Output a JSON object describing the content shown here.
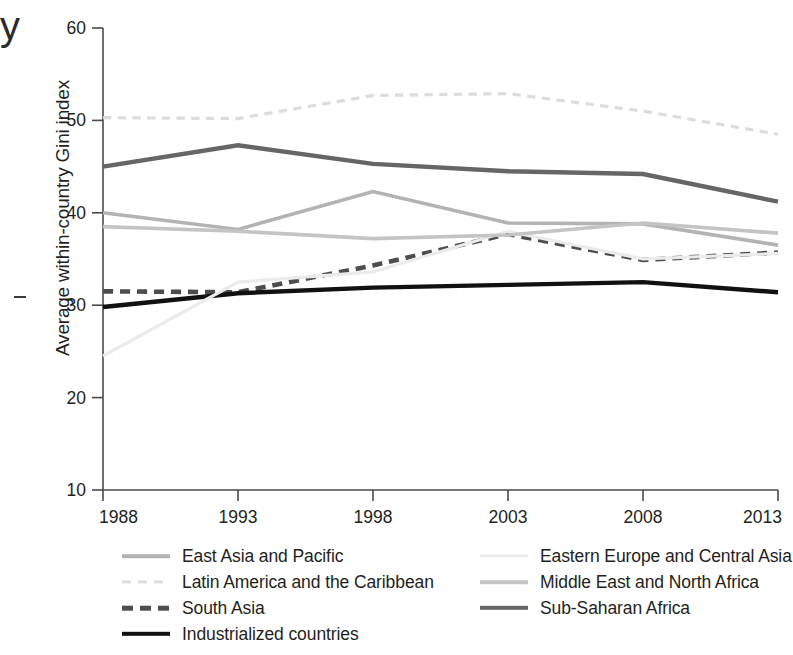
{
  "figure": {
    "cropped_text_fragment": "y",
    "y_axis_title": "Average within-country Gini index"
  },
  "chart_data": {
    "type": "line",
    "title": "",
    "xlabel": "",
    "ylabel": "Average within-country Gini index",
    "x": [
      1988,
      1993,
      1998,
      2003,
      2008,
      2013
    ],
    "xtick_labels": [
      "1988",
      "1993",
      "1998",
      "2003",
      "2008",
      "2013"
    ],
    "ytick_labels": [
      "10",
      "20",
      "30",
      "40",
      "50",
      "60"
    ],
    "yticks": [
      10,
      20,
      30,
      40,
      50,
      60
    ],
    "xlim": [
      1988,
      2013
    ],
    "ylim": [
      10,
      60
    ],
    "grid": false,
    "legend_position": "below-plot",
    "legend_columns": 2,
    "series": [
      {
        "name": "East Asia and Pacific",
        "values": [
          40.0,
          38.2,
          42.3,
          38.9,
          38.8,
          36.5
        ],
        "color": "#b3b3b3",
        "style": "solid",
        "width": 3.6,
        "legend_column": "left"
      },
      {
        "name": "Latin America and the Caribbean",
        "values": [
          50.3,
          50.2,
          52.7,
          52.9,
          51.0,
          48.5
        ],
        "color": "#dcdcdc",
        "style": "dashed",
        "width": 3.2,
        "legend_column": "left"
      },
      {
        "name": "South Asia",
        "values": [
          31.5,
          31.4,
          34.3,
          37.7,
          34.9,
          35.7
        ],
        "color": "#4d4d4d",
        "style": "dashed-bold",
        "width": 4.6,
        "legend_column": "left"
      },
      {
        "name": "Industrialized countries",
        "values": [
          29.8,
          31.3,
          31.9,
          32.2,
          32.5,
          31.4
        ],
        "color": "#111111",
        "style": "solid",
        "width": 4.4,
        "legend_column": "left"
      },
      {
        "name": "Eastern Europe and Central Asia",
        "values": [
          24.5,
          32.5,
          33.6,
          38.0,
          35.0,
          35.6
        ],
        "color": "#ebebeb",
        "style": "solid",
        "width": 3.2,
        "legend_column": "right"
      },
      {
        "name": "Middle East and North Africa",
        "values": [
          38.5,
          38.0,
          37.2,
          37.6,
          38.9,
          37.8
        ],
        "color": "#c4c4c4",
        "style": "solid",
        "width": 3.6,
        "legend_column": "right"
      },
      {
        "name": "Sub-Saharan Africa",
        "values": [
          45.0,
          47.3,
          45.3,
          44.5,
          44.2,
          41.2
        ],
        "color": "#666666",
        "style": "solid",
        "width": 4.4,
        "legend_column": "right"
      }
    ]
  },
  "legend": {
    "left_items": [
      "East Asia and Pacific",
      "Latin America and the Caribbean",
      "South Asia",
      "Industrialized countries"
    ],
    "right_items": [
      "Eastern Europe and Central Asia",
      "Middle East and North Africa",
      "Sub-Saharan Africa"
    ]
  }
}
